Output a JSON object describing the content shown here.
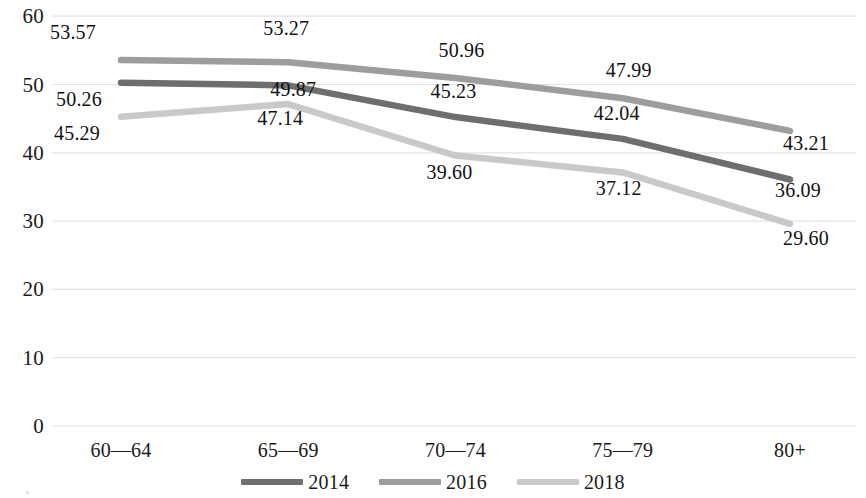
{
  "chart_data": {
    "type": "line",
    "title": "",
    "subtitle": "",
    "xlabel": "",
    "ylabel": "",
    "categories": [
      "60—64",
      "65—69",
      "70—74",
      "75—79",
      "80+"
    ],
    "series": [
      {
        "name": "2014",
        "color": "#6e6e6e",
        "values": [
          50.26,
          49.87,
          45.23,
          42.04,
          36.09
        ],
        "labels": [
          "50.26",
          "49.87",
          "45.23",
          "42.04",
          "36.09"
        ]
      },
      {
        "name": "2016",
        "color": "#9d9d9d",
        "values": [
          53.57,
          53.27,
          50.96,
          47.99,
          43.21
        ],
        "labels": [
          "53.57",
          "53.27",
          "50.96",
          "47.99",
          "43.21"
        ]
      },
      {
        "name": "2018",
        "color": "#c9c9c9",
        "values": [
          45.29,
          47.14,
          39.6,
          37.12,
          29.6
        ],
        "labels": [
          "45.29",
          "47.14",
          "39.60",
          "37.12",
          "29.60"
        ]
      }
    ],
    "ylim": [
      0,
      60
    ],
    "yticks": [
      0,
      10,
      20,
      30,
      40,
      50,
      60
    ],
    "ytick_labels": [
      "0",
      "10",
      "20",
      "30",
      "40",
      "50",
      "60"
    ],
    "grid": {
      "horizontal": true,
      "vertical": false,
      "color": "#e3e3e3"
    },
    "legend": {
      "position": "bottom",
      "entries": [
        "2014",
        "2016",
        "2018"
      ]
    }
  },
  "axis": {
    "y_labels": [
      "60",
      "50",
      "40",
      "30",
      "20",
      "10",
      "0"
    ],
    "x_labels": [
      "60—64",
      "65—69",
      "70—74",
      "75—79",
      "80+"
    ]
  },
  "legend": {
    "items": [
      {
        "label": "2014",
        "color": "#6e6e6e"
      },
      {
        "label": "2016",
        "color": "#9d9d9d"
      },
      {
        "label": "2018",
        "color": "#c9c9c9"
      }
    ]
  },
  "data_labels": {
    "s2014": [
      "50.26",
      "49.87",
      "45.23",
      "42.04",
      "36.09"
    ],
    "s2016": [
      "53.57",
      "53.27",
      "50.96",
      "47.99",
      "43.21"
    ],
    "s2018": [
      "45.29",
      "47.14",
      "39.60",
      "37.12",
      "29.60"
    ]
  }
}
